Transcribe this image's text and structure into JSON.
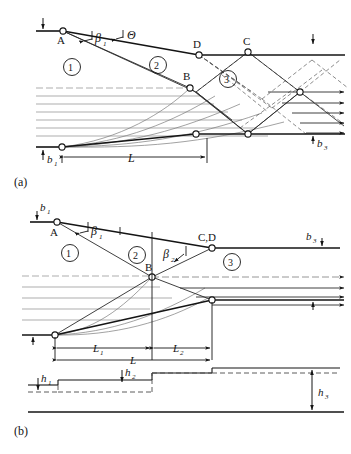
{
  "figure": {
    "type": "technical-line-diagram",
    "panels": [
      {
        "id": "a",
        "caption": "(a)",
        "description": "Contraction with separate points C and D, full wave-reflection pattern"
      },
      {
        "id": "b",
        "caption": "(b)",
        "description": "Contraction with coincident points C,D and depth profile h1-h2-h3"
      }
    ]
  },
  "panel_a": {
    "caption": "(a)",
    "points": [
      {
        "name": "A",
        "label": "A"
      },
      {
        "name": "B",
        "label": "B"
      },
      {
        "name": "D",
        "label": "D"
      },
      {
        "name": "C",
        "label": "C"
      }
    ],
    "regions": [
      {
        "id": "1",
        "label": "①"
      },
      {
        "id": "2",
        "label": "②"
      },
      {
        "id": "3",
        "label": "③"
      }
    ],
    "angles": [
      {
        "name": "beta1",
        "label": "β",
        "sub": "1"
      },
      {
        "name": "theta",
        "label": "Θ",
        "sub": ""
      }
    ],
    "dimensions": [
      {
        "name": "b1",
        "label": "b",
        "sub": "1"
      },
      {
        "name": "b3",
        "label": "b",
        "sub": "3"
      },
      {
        "name": "L",
        "label": "L",
        "sub": ""
      }
    ]
  },
  "panel_b": {
    "caption": "(b)",
    "points": [
      {
        "name": "A",
        "label": "A"
      },
      {
        "name": "B",
        "label": "B"
      },
      {
        "name": "CD",
        "label": "C,D"
      }
    ],
    "regions": [
      {
        "id": "1",
        "label": "①"
      },
      {
        "id": "2",
        "label": "②"
      },
      {
        "id": "3",
        "label": "③"
      }
    ],
    "angles": [
      {
        "name": "beta1",
        "label": "β",
        "sub": "1"
      },
      {
        "name": "beta2",
        "label": "β",
        "sub": "2"
      }
    ],
    "dimensions": [
      {
        "name": "b1",
        "label": "b",
        "sub": "1"
      },
      {
        "name": "b3",
        "label": "b",
        "sub": "3"
      },
      {
        "name": "L1",
        "label": "L",
        "sub": "1"
      },
      {
        "name": "L2",
        "label": "L",
        "sub": "2"
      },
      {
        "name": "L",
        "label": "L",
        "sub": ""
      }
    ],
    "depth_profile": [
      {
        "name": "h1",
        "label": "h",
        "sub": "1"
      },
      {
        "name": "h2",
        "label": "h",
        "sub": "2"
      },
      {
        "name": "h3",
        "label": "h",
        "sub": "3"
      }
    ]
  },
  "colors": {
    "ink": "#141414",
    "line": "#2a2a2a",
    "light": "#6e6e6e",
    "background": "#ffffff"
  }
}
